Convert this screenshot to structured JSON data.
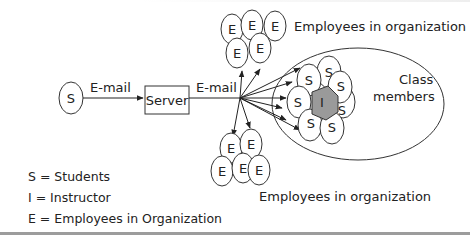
{
  "diagram": {
    "sender": {
      "symbol": "S"
    },
    "edge1_label": "E-mail",
    "server_label": "Server",
    "edge2_label": "E-mail",
    "top_group": {
      "label": "Employees in organization",
      "members": [
        "E",
        "E",
        "E",
        "E",
        "E"
      ]
    },
    "bottom_group": {
      "label": "Employees in organization",
      "members": [
        "E",
        "E",
        "E",
        "E",
        "E"
      ]
    },
    "class_group": {
      "label_line1": "Class",
      "label_line2": "members",
      "instructor": "I",
      "students": [
        "S",
        "S",
        "S",
        "S",
        "S",
        "S",
        "S",
        "S"
      ]
    }
  },
  "legend": {
    "items": [
      {
        "symbol": "S",
        "meaning": "Students",
        "text": "S = Students"
      },
      {
        "symbol": "I",
        "meaning": "Instructor",
        "text": "I  = Instructor"
      },
      {
        "symbol": "E",
        "meaning": "Employees in Organization",
        "text": "E = Employees in Organization"
      }
    ]
  },
  "colors": {
    "stroke": "#333333",
    "instructor_fill": "#9a9a9a",
    "rule": "#9c9c9c"
  }
}
